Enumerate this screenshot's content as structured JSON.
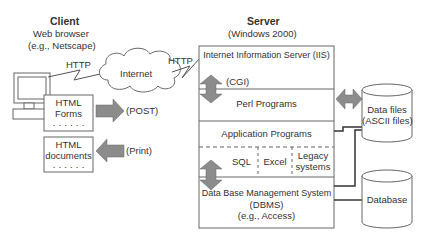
{
  "client": {
    "title": "Client",
    "subtitle": "Web browser",
    "example": "(e.g., Netscape)",
    "http_label": "HTTP",
    "forms_box": {
      "line1": "HTML",
      "line2": "Forms",
      "dots": "· · · · · ·"
    },
    "documents_box": {
      "line1": "HTML",
      "line2": "documents",
      "dots": "· · · · · ·"
    },
    "post_label": "(POST)",
    "print_label": "(Print)"
  },
  "internet": {
    "label": "Internet",
    "http_label": "HTTP"
  },
  "server": {
    "title": "Server",
    "subtitle": "(Windows 2000)",
    "iis": "Internet Information Server (IIS)",
    "cgi": "(CGI)",
    "perl": "Perl Programs",
    "app": "Application Programs",
    "sql": "SQL",
    "excel": "Excel",
    "legacy1": "Legacy",
    "legacy2": "systems",
    "dbms1": "Data Base Management System",
    "dbms2": "(DBMS)",
    "dbms3": "(e.g., Access)"
  },
  "storage": {
    "datafiles1": "Data files",
    "datafiles2": "(ASCII files)",
    "database": "Database"
  },
  "colors": {
    "arrow": "#8c8c8c",
    "line": "#555555",
    "text": "#333333"
  }
}
